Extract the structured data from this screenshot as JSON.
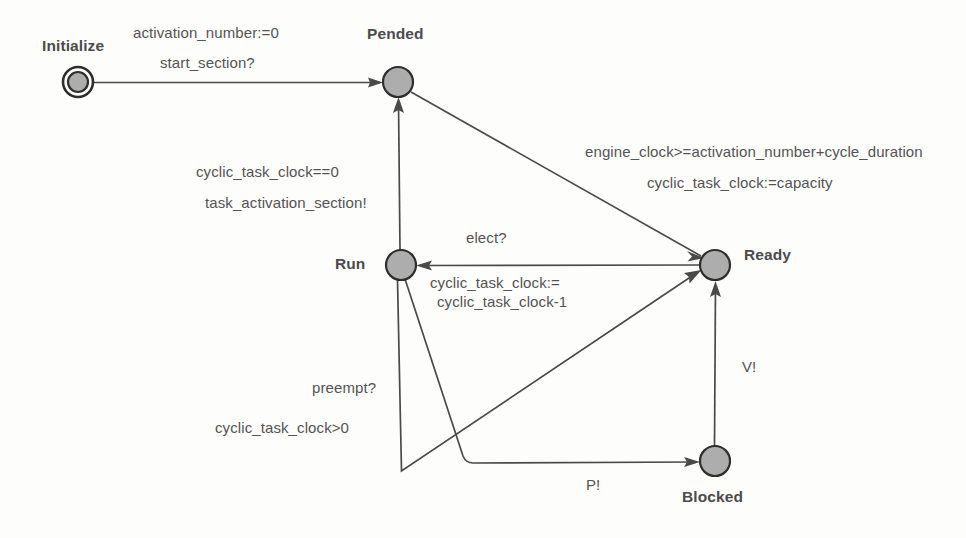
{
  "diagram": {
    "type": "state-machine",
    "title": "",
    "background_color": "#fdfdfc",
    "node_fill_color": "#adadad",
    "node_stroke_color": "#2e2e2e",
    "edge_color": "#4a4a4a",
    "label_color": "#555355",
    "states": [
      {
        "id": "initialize",
        "label": "Initialize",
        "kind": "initial",
        "cx": 78,
        "cy": 82,
        "r": 10,
        "outer_r": 15
      },
      {
        "id": "pended",
        "label": "Pended",
        "kind": "normal",
        "cx": 398,
        "cy": 82,
        "r": 15
      },
      {
        "id": "run",
        "label": "Run",
        "kind": "normal",
        "cx": 401,
        "cy": 265,
        "r": 15
      },
      {
        "id": "ready",
        "label": "Ready",
        "kind": "normal",
        "cx": 715,
        "cy": 265,
        "r": 15
      },
      {
        "id": "blocked",
        "label": "Blocked",
        "kind": "normal",
        "cx": 715,
        "cy": 461,
        "r": 15
      }
    ],
    "transitions": [
      {
        "id": "init-to-pended",
        "from": "initialize",
        "to": "pended",
        "labels": [
          "activation_number:=0",
          "start_section?"
        ]
      },
      {
        "id": "pended-to-ready",
        "from": "pended",
        "to": "ready",
        "labels": [
          "engine_clock>=activation_number+cycle_duration",
          "cyclic_task_clock:=capacity"
        ]
      },
      {
        "id": "run-to-pended",
        "from": "run",
        "to": "pended",
        "labels": [
          "cyclic_task_clock==0",
          "task_activation_section!"
        ]
      },
      {
        "id": "ready-to-run",
        "from": "ready",
        "to": "run",
        "labels": [
          "elect?",
          "cyclic_task_clock:=",
          "cyclic_task_clock-1"
        ]
      },
      {
        "id": "run-to-ready",
        "from": "run",
        "to": "ready",
        "labels": [
          "preempt?",
          "cyclic_task_clock>0"
        ]
      },
      {
        "id": "run-to-blocked",
        "from": "run",
        "to": "blocked",
        "labels": [
          "P!"
        ]
      },
      {
        "id": "blocked-to-ready",
        "from": "blocked",
        "to": "ready",
        "labels": [
          "V!"
        ]
      }
    ]
  },
  "labels": {
    "initialize": "Initialize",
    "pended": "Pended",
    "run": "Run",
    "ready": "Ready",
    "blocked": "Blocked",
    "activation_number_assign": "activation_number:=0",
    "start_section": "start_section?",
    "engine_clock_guard": "engine_clock>=activation_number+cycle_duration",
    "cyclic_task_clock_capacity": "cyclic_task_clock:=capacity",
    "cyclic_task_clock_zero": "cyclic_task_clock==0",
    "task_activation_section": "task_activation_section!",
    "elect": "elect?",
    "cyclic_task_clock_assign": "cyclic_task_clock:=",
    "cyclic_task_clock_minus": "cyclic_task_clock-1",
    "preempt": "preempt?",
    "cyclic_task_clock_gt_zero": "cyclic_task_clock>0",
    "p_signal": "P!",
    "v_signal": "V!"
  }
}
